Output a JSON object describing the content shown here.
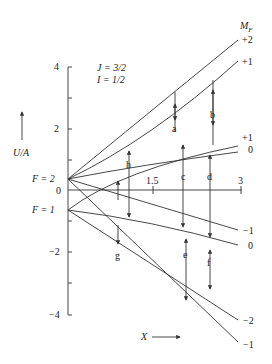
{
  "figure": {
    "params": {
      "J": "J = 3/2",
      "I": "I = 1/2"
    },
    "y_axis": {
      "label": "U/A",
      "ticks": [
        "4",
        "2",
        "0",
        "−2",
        "−4"
      ]
    },
    "x_axis": {
      "label": "X",
      "ticks": [
        "1.5",
        "3"
      ]
    },
    "levels": {
      "upper": "F = 2",
      "lower": "F = 1"
    },
    "mf_header": "M",
    "mf_header_sub": "F",
    "mf_labels": [
      "+2",
      "+1",
      "+1",
      "0",
      "−1",
      "0",
      "−2",
      "−1"
    ],
    "transitions": [
      "a",
      "b",
      "c",
      "d",
      "e",
      "f",
      "g",
      "h"
    ]
  },
  "colors": {
    "line": "#333333",
    "text": "#222222",
    "background": "#ffffff"
  }
}
